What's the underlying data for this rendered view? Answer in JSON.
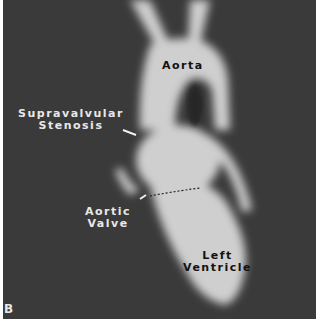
{
  "figure": {
    "panel_letter": "B",
    "labels": {
      "aorta": "Aorta",
      "supravalvular_line1": "Supravalvular",
      "supravalvular_line2": "Stenosis",
      "aortic_valve_line1": "Aortic",
      "aortic_valve_line2": "Valve",
      "left_ventricle_line1": "Left",
      "left_ventricle_line2": "Ventricle"
    }
  }
}
